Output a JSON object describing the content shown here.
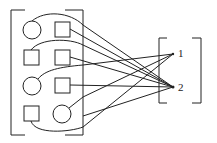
{
  "diagram": {
    "stroke_color": "#222222",
    "background": "#ffffff",
    "left_group": {
      "shapes": [
        {
          "id": "a1",
          "type": "circle",
          "row": 1,
          "col": 1
        },
        {
          "id": "a2",
          "type": "square",
          "row": 1,
          "col": 2
        },
        {
          "id": "b1",
          "type": "square",
          "row": 2,
          "col": 1
        },
        {
          "id": "b2",
          "type": "square",
          "row": 2,
          "col": 2
        },
        {
          "id": "c1",
          "type": "circle",
          "row": 3,
          "col": 1
        },
        {
          "id": "c2",
          "type": "square",
          "row": 3,
          "col": 2
        },
        {
          "id": "d1",
          "type": "square",
          "row": 4,
          "col": 1
        },
        {
          "id": "d2",
          "type": "circle",
          "row": 4,
          "col": 2
        }
      ]
    },
    "right_group": {
      "nodes": [
        {
          "id": "n1",
          "label": "1"
        },
        {
          "id": "n2",
          "label": "2"
        }
      ]
    },
    "edges": [
      {
        "from": "a1",
        "to": "n2"
      },
      {
        "from": "a2",
        "to": "n2"
      },
      {
        "from": "b1",
        "to": "n2"
      },
      {
        "from": "b2",
        "to": "n2"
      },
      {
        "from": "c1",
        "to": "n1"
      },
      {
        "from": "c2",
        "to": "n2"
      },
      {
        "from": "d1",
        "to": "n1"
      },
      {
        "from": "d2",
        "to": "n1"
      }
    ]
  }
}
